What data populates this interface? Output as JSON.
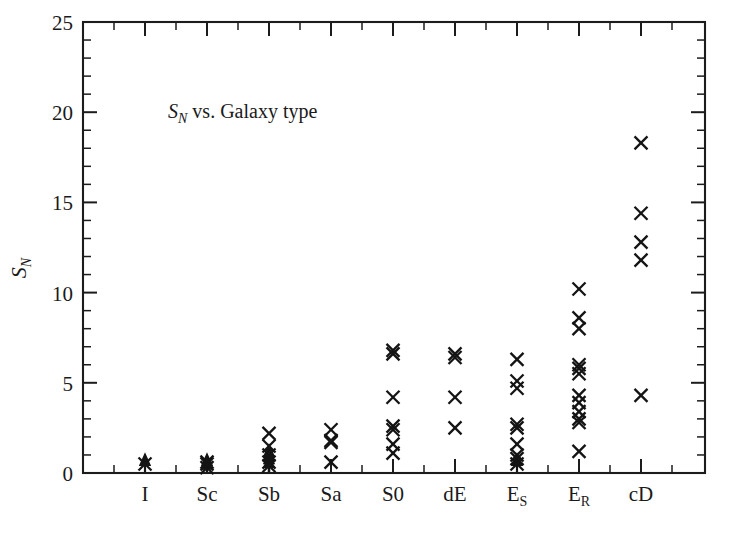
{
  "figure": {
    "background_color": "#ffffff",
    "ink_color": "#141414",
    "width": 730,
    "height": 533
  },
  "annotation": {
    "symbol": "S",
    "subscript": "N",
    "rest": " vs. Galaxy type"
  },
  "axis_title_y": {
    "symbol": "S",
    "subscript": "N"
  },
  "chart_data": {
    "type": "scatter",
    "xlabel": "",
    "ylabel": "S_N",
    "grid": false,
    "legend": "none",
    "marker": "x",
    "categories": [
      "I",
      "Sc",
      "Sb",
      "Sa",
      "S0",
      "dE",
      "E_S",
      "E_R",
      "cD"
    ],
    "category_labels": [
      {
        "base": "I",
        "sub": ""
      },
      {
        "base": "Sc",
        "sub": ""
      },
      {
        "base": "Sb",
        "sub": ""
      },
      {
        "base": "Sa",
        "sub": ""
      },
      {
        "base": "S0",
        "sub": ""
      },
      {
        "base": "dE",
        "sub": ""
      },
      {
        "base": "E",
        "sub": "S"
      },
      {
        "base": "E",
        "sub": "R"
      },
      {
        "base": "cD",
        "sub": ""
      }
    ],
    "ylim": [
      0,
      25
    ],
    "y_major_ticks": [
      0,
      5,
      10,
      15,
      20,
      25
    ],
    "y_minor_step": 1,
    "x_tick_labels": [
      "I",
      "Sc",
      "Sb",
      "Sa",
      "S0",
      "dE",
      "E_S",
      "E_R",
      "cD"
    ],
    "series": [
      {
        "name": "Specific frequency measurements",
        "points": [
          {
            "category": "I",
            "y": 0.5,
            "upper_limit": true
          },
          {
            "category": "Sc",
            "y": 0.6,
            "upper_limit": false
          },
          {
            "category": "Sc",
            "y": 0.5,
            "upper_limit": true
          },
          {
            "category": "Sc",
            "y": 0.3,
            "upper_limit": true
          },
          {
            "category": "Sb",
            "y": 2.2,
            "upper_limit": false
          },
          {
            "category": "Sb",
            "y": 1.5,
            "upper_limit": false
          },
          {
            "category": "Sb",
            "y": 1.0,
            "upper_limit": true
          },
          {
            "category": "Sb",
            "y": 0.6,
            "upper_limit": true
          },
          {
            "category": "Sb",
            "y": 0.4,
            "upper_limit": true
          },
          {
            "category": "Sa",
            "y": 2.4,
            "upper_limit": false
          },
          {
            "category": "Sa",
            "y": 1.7,
            "upper_limit": false
          },
          {
            "category": "Sa",
            "y": 1.8,
            "upper_limit": false
          },
          {
            "category": "Sa",
            "y": 0.6,
            "upper_limit": false
          },
          {
            "category": "S0",
            "y": 6.8,
            "upper_limit": false
          },
          {
            "category": "S0",
            "y": 6.6,
            "upper_limit": false
          },
          {
            "category": "S0",
            "y": 4.2,
            "upper_limit": false
          },
          {
            "category": "S0",
            "y": 2.6,
            "upper_limit": false
          },
          {
            "category": "S0",
            "y": 2.4,
            "upper_limit": false
          },
          {
            "category": "S0",
            "y": 1.6,
            "upper_limit": false
          },
          {
            "category": "S0",
            "y": 1.1,
            "upper_limit": false
          },
          {
            "category": "dE",
            "y": 6.6,
            "upper_limit": false
          },
          {
            "category": "dE",
            "y": 6.4,
            "upper_limit": false
          },
          {
            "category": "dE",
            "y": 4.2,
            "upper_limit": false
          },
          {
            "category": "dE",
            "y": 2.5,
            "upper_limit": false
          },
          {
            "category": "E_S",
            "y": 6.3,
            "upper_limit": false
          },
          {
            "category": "E_S",
            "y": 5.1,
            "upper_limit": false
          },
          {
            "category": "E_S",
            "y": 4.7,
            "upper_limit": false
          },
          {
            "category": "E_S",
            "y": 2.7,
            "upper_limit": false
          },
          {
            "category": "E_S",
            "y": 2.5,
            "upper_limit": false
          },
          {
            "category": "E_S",
            "y": 1.6,
            "upper_limit": false
          },
          {
            "category": "E_S",
            "y": 1.0,
            "upper_limit": false
          },
          {
            "category": "E_S",
            "y": 0.8,
            "upper_limit": false
          },
          {
            "category": "E_S",
            "y": 0.5,
            "upper_limit": true
          },
          {
            "category": "E_R",
            "y": 10.2,
            "upper_limit": false
          },
          {
            "category": "E_R",
            "y": 8.6,
            "upper_limit": false
          },
          {
            "category": "E_R",
            "y": 8.0,
            "upper_limit": false
          },
          {
            "category": "E_R",
            "y": 6.0,
            "upper_limit": false
          },
          {
            "category": "E_R",
            "y": 5.8,
            "upper_limit": false
          },
          {
            "category": "E_R",
            "y": 5.5,
            "upper_limit": false
          },
          {
            "category": "E_R",
            "y": 4.3,
            "upper_limit": false
          },
          {
            "category": "E_R",
            "y": 3.9,
            "upper_limit": false
          },
          {
            "category": "E_R",
            "y": 3.4,
            "upper_limit": false
          },
          {
            "category": "E_R",
            "y": 3.0,
            "upper_limit": false
          },
          {
            "category": "E_R",
            "y": 2.8,
            "upper_limit": false
          },
          {
            "category": "E_R",
            "y": 1.2,
            "upper_limit": false
          },
          {
            "category": "cD",
            "y": 18.3,
            "upper_limit": false
          },
          {
            "category": "cD",
            "y": 14.4,
            "upper_limit": false
          },
          {
            "category": "cD",
            "y": 12.8,
            "upper_limit": false
          },
          {
            "category": "cD",
            "y": 11.8,
            "upper_limit": false
          },
          {
            "category": "cD",
            "y": 4.3,
            "upper_limit": false
          }
        ]
      }
    ]
  }
}
